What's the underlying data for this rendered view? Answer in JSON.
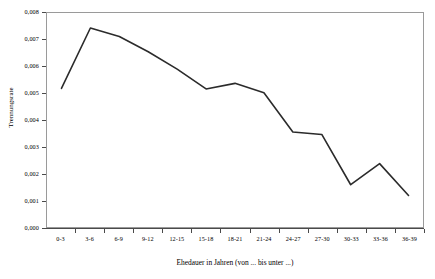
{
  "chart_data": {
    "type": "line",
    "title": "",
    "xlabel": "Ehedauer in Jahren (von ... bis unter ...)",
    "ylabel": "Trennungsrate",
    "categories": [
      "0-3",
      "3-6",
      "6-9",
      "9-12",
      "12-15",
      "15-18",
      "18-21",
      "21-24",
      "24-27",
      "27-30",
      "30-33",
      "33-36",
      "36-39"
    ],
    "values": [
      0.00518,
      0.00744,
      0.00712,
      0.00655,
      0.0059,
      0.00516,
      0.00537,
      0.00502,
      0.00355,
      0.00346,
      0.00158,
      0.00237,
      0.00118
    ],
    "ylim": [
      0,
      0.008
    ],
    "ytick_labels": [
      "0,000",
      "0,001",
      "0,002",
      "0,003",
      "0,004",
      "0,005",
      "0,006",
      "0,007",
      "0,008"
    ],
    "ytick_values": [
      0,
      0.001,
      0.002,
      0.003,
      0.004,
      0.005,
      0.006,
      0.007,
      0.008
    ],
    "grid": false,
    "legend": false,
    "line_color": "#2b2b2b",
    "axis_color": "#4a4a4a",
    "frame_color": "#9a9a9a",
    "background": "#ffffff"
  }
}
